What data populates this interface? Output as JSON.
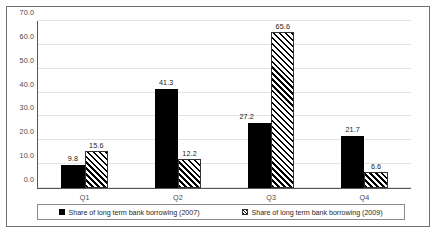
{
  "chart_data": {
    "type": "bar",
    "title": "",
    "subtitle": "",
    "xlabel": "",
    "ylabel": "",
    "categories": [
      "Q1",
      "Q2",
      "Q3",
      "Q4"
    ],
    "series": [
      {
        "name": "Share of long term bank borrowing (2007)",
        "values": [
          9.8,
          41.3,
          27.2,
          21.7
        ],
        "value_labels": [
          "9.8",
          "41.3",
          "27.2",
          "21.7"
        ],
        "fill": "solid-black",
        "color": "#000000"
      },
      {
        "name": "Share of long term bank borrowing (2009)",
        "values": [
          15.6,
          12.2,
          65.6,
          6.6
        ],
        "value_labels": [
          "15.6",
          "12.2",
          "65.6",
          "6.6"
        ],
        "fill": "diagonal-hatch",
        "color": "#ffffff"
      }
    ],
    "ylim": [
      0,
      70
    ],
    "ytick_step": 10,
    "ytick_labels": [
      "0.0",
      "10.0",
      "20.0",
      "30.0",
      "40.0",
      "50.0",
      "60.0",
      "70.0"
    ],
    "ytick_values": [
      0,
      10,
      20,
      30,
      40,
      50,
      60,
      70
    ],
    "grid": true,
    "grid_axis": "y",
    "legend_position": "bottom",
    "legend_entries": [
      "Share of long term bank borrowing (2007)",
      "Share of long term bank borrowing (2009)"
    ],
    "data_labels_shown": true,
    "frame": true,
    "background": "#ffffff"
  }
}
